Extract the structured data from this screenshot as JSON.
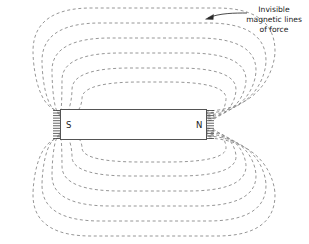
{
  "figure": {
    "kind": "magnetic-field-diagram",
    "background_color": "#ffffff",
    "width": 309,
    "height": 244
  },
  "magnet": {
    "south_pole_label": "S",
    "north_pole_label": "N",
    "outline_color": "#545454",
    "fill_color": "#ffffff",
    "x": 60,
    "y": 109,
    "width": 147,
    "height": 31
  },
  "annotation": {
    "line1": "Invisible",
    "line2": "magnetic lines",
    "line3": "of force",
    "text_color": "#1a1a1a",
    "arrow_color": "#2b2b2b"
  },
  "field_lines": {
    "style": "dashed",
    "color": "#8a8a8a",
    "dash_pattern": "3,2.6",
    "stroke_width": 0.9,
    "loop_count_per_side": 6,
    "upper_loops": [
      {
        "index": 1,
        "top_y": 8,
        "left_x": 33,
        "right_x": 275,
        "pole_y": 111
      },
      {
        "index": 2,
        "top_y": 23,
        "left_x": 42,
        "right_x": 266,
        "pole_y": 113
      },
      {
        "index": 3,
        "top_y": 38,
        "left_x": 52,
        "right_x": 256,
        "pole_y": 115
      },
      {
        "index": 4,
        "top_y": 53,
        "left_x": 62,
        "right_x": 246,
        "pole_y": 117
      },
      {
        "index": 5,
        "top_y": 68,
        "left_x": 72,
        "right_x": 236,
        "pole_y": 119
      },
      {
        "index": 6,
        "top_y": 82,
        "left_x": 82,
        "right_x": 226,
        "pole_y": 121
      }
    ],
    "lower_loops": [
      {
        "index": 1,
        "bottom_y": 236,
        "left_x": 33,
        "right_x": 275,
        "pole_y": 138
      },
      {
        "index": 2,
        "bottom_y": 221,
        "left_x": 42,
        "right_x": 266,
        "pole_y": 136
      },
      {
        "index": 3,
        "bottom_y": 206,
        "left_x": 52,
        "right_x": 256,
        "pole_y": 134
      },
      {
        "index": 4,
        "bottom_y": 191,
        "left_x": 62,
        "right_x": 246,
        "pole_y": 132
      },
      {
        "index": 5,
        "bottom_y": 176,
        "left_x": 72,
        "right_x": 236,
        "pole_y": 130
      },
      {
        "index": 6,
        "bottom_y": 162,
        "left_x": 82,
        "right_x": 226,
        "pole_y": 128
      }
    ]
  },
  "pole_ticks": {
    "color": "#3d3d3d",
    "count_per_pole": 12,
    "length": 7
  }
}
